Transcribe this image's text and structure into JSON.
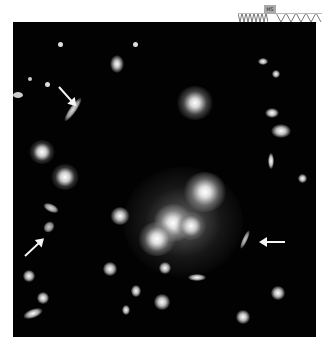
{
  "figure": {
    "background_color": "#020202"
  },
  "badge": {
    "tag_label": "HS",
    "icon": "telescope-icon"
  },
  "arrows": [
    {
      "name": "arrow-top-left",
      "target": "lensed-arc-upper-left"
    },
    {
      "name": "arrow-lower-left",
      "target": "lensed-arc-lower-left"
    },
    {
      "name": "arrow-right",
      "target": "lensed-arc-right"
    }
  ]
}
